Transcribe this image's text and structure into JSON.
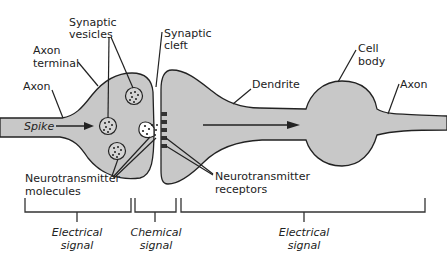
{
  "diagram": {
    "labels": {
      "synaptic_vesicles_1": "Synaptic",
      "synaptic_vesicles_2": "vesicles",
      "synaptic_cleft_1": "Synaptic",
      "synaptic_cleft_2": "cleft",
      "axon_terminal_1": "Axon",
      "axon_terminal_2": "terminal",
      "axon_left": "Axon",
      "spike": "Spike",
      "nt_molecules_1": "Neurotransmitter",
      "nt_molecules_2": "molecules",
      "nt_receptors_1": "Neurotransmitter",
      "nt_receptors_2": "receptors",
      "dendrite": "Dendrite",
      "cell_body_1": "Cell",
      "cell_body_2": "body",
      "axon_right": "Axon"
    },
    "brackets": [
      {
        "line1": "Electrical",
        "line2": "signal"
      },
      {
        "line1": "Chemical",
        "line2": "signal"
      },
      {
        "line1": "Electrical",
        "line2": "signal"
      }
    ],
    "colors": {
      "cell_fill": "#c8c8c8",
      "outline": "#222222"
    }
  }
}
